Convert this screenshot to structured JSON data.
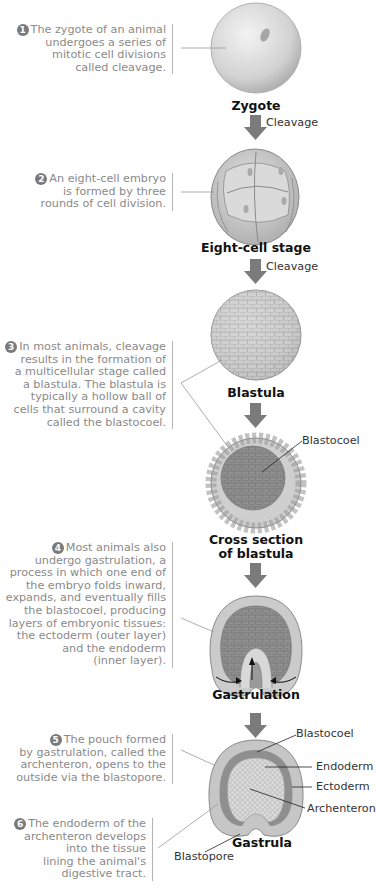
{
  "steps": [
    {
      "num": "1",
      "text": "The zygote of an animal undergoes a series of mitotic cell divisions called cleavage.",
      "lines": [
        "The zygote of an animal",
        "undergoes a series of",
        "mitotic cell divisions",
        "called cleavage."
      ]
    },
    {
      "num": "2",
      "lines": [
        "An eight-cell embryo",
        "is formed by three",
        "rounds of cell division."
      ]
    },
    {
      "num": "3",
      "lines": [
        "In most animals, cleavage",
        "results in the formation of",
        "a multicellular stage called",
        "a blastula. The blastula is",
        "typically a hollow ball of",
        "cells that surround a cavity",
        "called the blastocoel."
      ]
    },
    {
      "num": "4",
      "lines": [
        "Most animals also",
        "undergo gastrulation, a",
        "process in which one end of",
        "the embryo folds inward,",
        "expands, and eventually fills",
        "the blastocoel, producing",
        "layers of embryonic tissues:",
        "the ectoderm (outer layer)",
        "and the endoderm",
        "(inner layer)."
      ]
    },
    {
      "num": "5",
      "lines": [
        "The pouch formed",
        "by gastrulation, called the",
        "archenteron, opens to the",
        "outside via the blastopore."
      ]
    },
    {
      "num": "6",
      "lines": [
        "The endoderm of the",
        "archenteron develops",
        "into the tissue",
        "lining the animal's",
        "digestive tract."
      ]
    }
  ],
  "stages": {
    "zygote": "Zygote",
    "eight_cell": "Eight-cell stage",
    "blastula": "Blastula",
    "cross_section_1": "Cross section",
    "cross_section_2": "of blastula",
    "gastrulation": "Gastrulation",
    "gastrula": "Gastrula"
  },
  "arrows": {
    "cleavage_1": "Cleavage",
    "cleavage_2": "Cleavage"
  },
  "labels": {
    "blastocoel_1": "Blastocoel",
    "blastocoel_2": "Blastocoel",
    "endoderm": "Endoderm",
    "ectoderm": "Ectoderm",
    "archenteron": "Archenteron",
    "blastopore": "Blastopore"
  },
  "colors": {
    "arrow": "#7b7b7b",
    "caption_text": "#8a8a8a",
    "cell_fill": "#c8c8c8",
    "dark_fill": "#8c8c8c"
  }
}
